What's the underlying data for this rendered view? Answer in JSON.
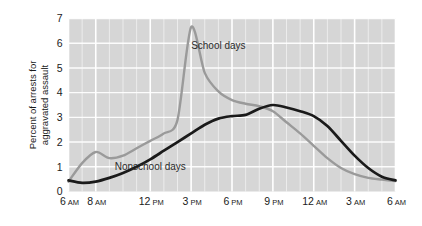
{
  "chart_data": {
    "type": "line",
    "title": "",
    "xlabel": "",
    "ylabel": "Percent of arrests for aggravated assault",
    "ylabel_line1": "Percent of arrests for",
    "ylabel_line2": "aggravated assault",
    "ylim": [
      0,
      7
    ],
    "yticks": [
      0,
      1,
      2,
      3,
      4,
      5,
      6,
      7
    ],
    "ytick_labels": [
      "0",
      "1",
      "2",
      "3",
      "4",
      "5",
      "6",
      "7"
    ],
    "grid": true,
    "grid_color": "#ffffff",
    "plot_bg": "#d6d6d6",
    "legend_position": "inline-annotation",
    "xlim_hours": [
      6,
      30
    ],
    "xticks_hours": [
      6,
      8,
      12,
      15,
      18,
      21,
      24,
      27,
      30
    ],
    "xtick_labels": [
      {
        "num": "6",
        "ampm": "AM"
      },
      {
        "num": "8",
        "ampm": "AM"
      },
      {
        "num": "12",
        "ampm": "PM"
      },
      {
        "num": "3",
        "ampm": "PM"
      },
      {
        "num": "6",
        "ampm": "PM"
      },
      {
        "num": "9",
        "ampm": "PM"
      },
      {
        "num": "12",
        "ampm": "AM"
      },
      {
        "num": "3",
        "ampm": "AM"
      },
      {
        "num": "6",
        "ampm": "AM"
      }
    ],
    "x_hours": [
      6,
      7,
      8,
      9,
      10,
      11,
      12,
      13,
      14,
      15,
      16,
      17,
      18,
      19,
      20,
      21,
      22,
      23,
      24,
      25,
      26,
      27,
      28,
      29,
      30
    ],
    "series": [
      {
        "name": "School days",
        "color": "#9a9a9a",
        "annotation": "School days",
        "values": [
          0.4,
          1.15,
          1.6,
          1.35,
          1.45,
          1.75,
          2.05,
          2.35,
          2.9,
          6.65,
          4.8,
          4.05,
          3.7,
          3.55,
          3.45,
          3.25,
          2.8,
          2.35,
          1.85,
          1.35,
          0.95,
          0.7,
          0.55,
          0.48,
          0.42
        ]
      },
      {
        "name": "Nonschool days",
        "color": "#1a1a1a",
        "annotation": "Nonschool days",
        "values": [
          0.45,
          0.35,
          0.4,
          0.55,
          0.75,
          1.0,
          1.3,
          1.65,
          2.0,
          2.35,
          2.7,
          2.95,
          3.05,
          3.1,
          3.35,
          3.5,
          3.4,
          3.25,
          3.05,
          2.65,
          2.05,
          1.45,
          0.95,
          0.6,
          0.45
        ]
      }
    ],
    "annotations": [
      {
        "text": "School days",
        "x_hours": 17.0,
        "y": 5.75
      },
      {
        "text": "Nonschool days",
        "x_hours": 12.0,
        "y": 0.85
      }
    ]
  }
}
